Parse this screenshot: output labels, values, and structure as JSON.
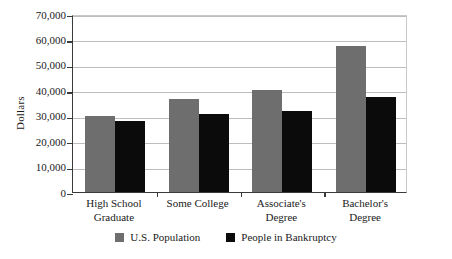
{
  "chart_data": {
    "type": "bar",
    "title": "",
    "xlabel": "",
    "ylabel": "Dollars",
    "ylim": [
      0,
      70000
    ],
    "ytick_step": 10000,
    "grid": true,
    "legend_position": "bottom-center",
    "categories": [
      "High School Graduate",
      "Some College",
      "Associate's Degree",
      "Bachelor's Degree"
    ],
    "category_lines": [
      [
        "High School",
        "Graduate"
      ],
      [
        "Some College",
        ""
      ],
      [
        "Associate's",
        "Degree"
      ],
      [
        "Bachelor's",
        "Degree"
      ]
    ],
    "ytick_labels": [
      "70,000",
      "60,000",
      "50,000",
      "40,000",
      "30,000",
      "20,000",
      "10,000",
      "0"
    ],
    "ytick_values": [
      70000,
      60000,
      50000,
      40000,
      30000,
      20000,
      10000,
      0
    ],
    "series": [
      {
        "name": "U.S. Population",
        "color": "#6e6e6e",
        "values": [
          30000,
          36500,
          40000,
          57500
        ]
      },
      {
        "name": "People in Bankruptcy",
        "color": "#0b0b0b",
        "values": [
          28000,
          30500,
          32000,
          37500
        ]
      }
    ]
  },
  "legend": {
    "entries": [
      {
        "label": "U.S. Population",
        "color": "#6e6e6e"
      },
      {
        "label": "People in Bankruptcy",
        "color": "#0b0b0b"
      }
    ]
  },
  "axis": {
    "y_title": "Dollars"
  },
  "colors": {
    "background": "#ffffff",
    "axis": "#3a3a3a",
    "gridline": "#bdbdbd",
    "text": "#1a1a1a",
    "series_population": "#6e6e6e",
    "series_bankruptcy": "#0b0b0b"
  }
}
